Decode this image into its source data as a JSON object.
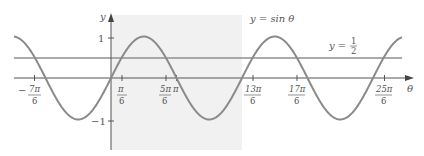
{
  "chart_data": {
    "type": "line",
    "title": "",
    "xlabel": "θ",
    "ylabel": "y",
    "xlim_rad": [
      -1.93,
      14.2
    ],
    "ylim": [
      -1.4,
      1.4
    ],
    "grid": false,
    "shaded_interval": {
      "from": "0",
      "to": "2π",
      "color": "#f0f0f0"
    },
    "series": [
      {
        "name": "y = sin θ",
        "function": "sin",
        "color": "#8a8a8a"
      },
      {
        "name": "y = 1/2",
        "function": "constant",
        "value": 0.5,
        "color": "#8a8a8a"
      }
    ],
    "x_ticks": [
      {
        "num": "7π",
        "den": "6",
        "sign": "−",
        "value": -3.665
      },
      {
        "num": "π",
        "den": "6",
        "sign": "",
        "value": 0.5236
      },
      {
        "num": "5π",
        "den": "6",
        "sign": "",
        "value": 2.618
      },
      {
        "num": "13π",
        "den": "6",
        "sign": "",
        "value": 6.807
      },
      {
        "num": "17π",
        "den": "6",
        "sign": "",
        "value": 8.901
      },
      {
        "num": "25π",
        "den": "6",
        "sign": "",
        "value": 13.09
      }
    ],
    "extra_x_tick_label": "π",
    "y_ticks": [
      {
        "label": "1",
        "value": 1
      },
      {
        "label": "−1",
        "value": -1
      }
    ],
    "annotations": [
      {
        "text": "y = sin θ"
      },
      {
        "text": "y =",
        "frac_num": "1",
        "frac_den": "2"
      }
    ],
    "intersections_with_half": [
      "−7π/6",
      "π/6",
      "5π/6",
      "13π/6",
      "17π/6",
      "25π/6"
    ]
  },
  "labels": {
    "y_axis": "y",
    "x_axis": "θ",
    "sin_label": "y = sin θ",
    "half_label_prefix": "y =",
    "half_num": "1",
    "half_den": "2",
    "y_one": "1",
    "y_neg_one": "−1",
    "pi": "π",
    "minus": "−",
    "t1_num": "7π",
    "t1_den": "6",
    "t2_num": "π",
    "t2_den": "6",
    "t3_num": "5π",
    "t3_den": "6",
    "t4_num": "13π",
    "t4_den": "6",
    "t5_num": "17π",
    "t5_den": "6",
    "t6_num": "25π",
    "t6_den": "6"
  }
}
